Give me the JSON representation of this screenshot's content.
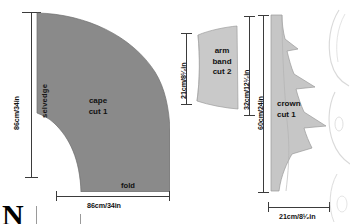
{
  "figure": {
    "type": "sewing-pattern-cutting-layout",
    "fabric_fill_cape": "#8a8a8a",
    "fabric_fill_armband": "#c9c9c9",
    "fabric_fill_crown": "#c6c6c6",
    "rule_color": "#3b3b3b",
    "text_color": "#111111"
  },
  "pieces": [
    {
      "id": "cape",
      "name_line1": "cape",
      "name_line2": "cut 1",
      "edge_labels": {
        "left": "selvedge",
        "bottom": "fold"
      },
      "dimensions": {
        "height": "86cm/34in",
        "width": "86cm/34in"
      }
    },
    {
      "id": "arm-band",
      "name_line1": "arm",
      "name_line2": "band",
      "name_line3": "cut 2",
      "dimensions": {
        "height": "21cm/8¹⁄₂in",
        "height_right": "32cm/12¹⁄₂in"
      }
    },
    {
      "id": "crown",
      "name_line1": "crown",
      "name_line2": "cut 1",
      "dimensions": {
        "height": "60cm/24in",
        "width": "21cm/8¹⁄₂in"
      }
    }
  ],
  "caption": {
    "drop_cap": "N"
  }
}
